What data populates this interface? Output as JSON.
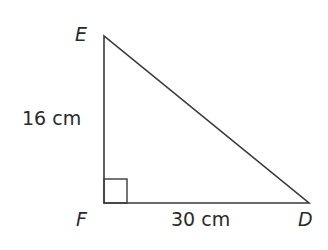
{
  "diagram": {
    "type": "right-triangle",
    "vertices": [
      {
        "name": "E",
        "x": 104,
        "y": 36
      },
      {
        "name": "F",
        "x": 104,
        "y": 203
      },
      {
        "name": "D",
        "x": 309,
        "y": 203
      }
    ],
    "right_angle_at": "F",
    "labels": {
      "E": "E",
      "F": "F",
      "D": "D",
      "side_EF": "16 cm",
      "side_FD": "30 cm"
    },
    "colors": {
      "stroke": "#3a3a3a",
      "text": "#2a2a2a",
      "background": "#ffffff"
    }
  }
}
